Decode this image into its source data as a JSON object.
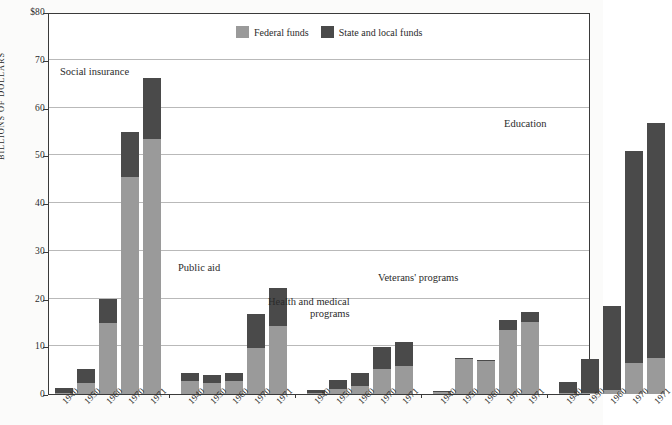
{
  "chart_data": {
    "type": "bar",
    "subtype": "stacked-grouped",
    "title": "",
    "subtitle": "",
    "xlabel": "",
    "ylabel": "BILLIONS OF DOLLARS",
    "ylim": [
      0,
      80
    ],
    "yticks": [
      0,
      10,
      20,
      30,
      40,
      50,
      60,
      70,
      80
    ],
    "ytick_labels": [
      "0",
      "10",
      "20",
      "30",
      "40",
      "50",
      "60",
      "70",
      "$80"
    ],
    "grid": true,
    "legend_position": "top-center",
    "colors": {
      "federal": "#9a9a9a",
      "state_local": "#4a4a4a",
      "frame": "#3a3a3a",
      "gridline": "#b9b9b9",
      "background": "#ffffff"
    },
    "legend": [
      {
        "label": "Federal funds",
        "color": "#9a9a9a",
        "key": "federal"
      },
      {
        "label": "State and local funds",
        "color": "#4a4a4a",
        "key": "state_local"
      }
    ],
    "series": [
      {
        "name": "Federal funds",
        "key": "federal"
      },
      {
        "name": "State and local funds",
        "key": "state_local"
      }
    ],
    "categories": [
      "1940",
      "1950",
      "1960",
      "1970",
      "1971"
    ],
    "groups": [
      {
        "name": "Social insurance",
        "annotation": "Social insurance",
        "bars": [
          {
            "x": "1940",
            "federal": 0.3,
            "state_local": 1.0,
            "total": 1.3
          },
          {
            "x": "1950",
            "federal": 2.4,
            "state_local": 2.8,
            "total": 5.2
          },
          {
            "x": "1960",
            "federal": 14.9,
            "state_local": 5.1,
            "total": 20.0
          },
          {
            "x": "1970",
            "federal": 45.5,
            "state_local": 9.3,
            "total": 54.8
          },
          {
            "x": "1971",
            "federal": 53.4,
            "state_local": 12.8,
            "total": 66.2
          }
        ]
      },
      {
        "name": "Public aid",
        "annotation": "Public aid",
        "bars": [
          {
            "x": "1940",
            "federal": 2.8,
            "state_local": 1.7,
            "total": 4.5
          },
          {
            "x": "1950",
            "federal": 2.4,
            "state_local": 1.5,
            "total": 3.9
          },
          {
            "x": "1960",
            "federal": 2.8,
            "state_local": 1.7,
            "total": 4.5
          },
          {
            "x": "1970",
            "federal": 9.6,
            "state_local": 7.1,
            "total": 16.7
          },
          {
            "x": "1971",
            "federal": 14.2,
            "state_local": 8.1,
            "total": 22.3
          }
        ]
      },
      {
        "name": "Health and medical programs",
        "annotation": "Health and medical\nprograms",
        "annotation_line1": "Health and medical",
        "annotation_line2": "programs",
        "bars": [
          {
            "x": "1940",
            "federal": 0.3,
            "state_local": 0.5,
            "total": 0.8
          },
          {
            "x": "1950",
            "federal": 1.0,
            "state_local": 2.0,
            "total": 3.0
          },
          {
            "x": "1960",
            "federal": 1.7,
            "state_local": 2.7,
            "total": 4.4
          },
          {
            "x": "1970",
            "federal": 5.2,
            "state_local": 4.7,
            "total": 9.9
          },
          {
            "x": "1971",
            "federal": 5.8,
            "state_local": 5.1,
            "total": 10.9
          }
        ]
      },
      {
        "name": "Veterans' programs",
        "annotation": "Veterans' programs",
        "bars": [
          {
            "x": "1940",
            "federal": 0.5,
            "state_local": 0.1,
            "total": 0.6
          },
          {
            "x": "1950",
            "federal": 7.4,
            "state_local": 0.2,
            "total": 7.6
          },
          {
            "x": "1960",
            "federal": 7.0,
            "state_local": 0.2,
            "total": 7.2
          },
          {
            "x": "1970",
            "federal": 13.5,
            "state_local": 1.9,
            "total": 15.4
          },
          {
            "x": "1971",
            "federal": 15.1,
            "state_local": 2.0,
            "total": 17.1
          }
        ]
      },
      {
        "name": "Education",
        "annotation": "Education",
        "bars": [
          {
            "x": "1940",
            "federal": 0.2,
            "state_local": 2.4,
            "total": 2.6
          },
          {
            "x": "1950",
            "federal": 0.3,
            "state_local": 7.0,
            "total": 7.3
          },
          {
            "x": "1960",
            "federal": 0.8,
            "state_local": 17.7,
            "total": 18.5
          },
          {
            "x": "1970",
            "federal": 6.5,
            "state_local": 44.3,
            "total": 50.8
          },
          {
            "x": "1971",
            "federal": 7.5,
            "state_local": 49.3,
            "total": 56.8
          }
        ]
      }
    ]
  }
}
